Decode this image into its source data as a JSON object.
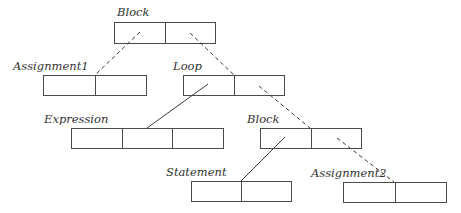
{
  "diagram": {
    "type": "tree",
    "nodes": [
      {
        "id": "block-root",
        "label": "Block",
        "x": 114,
        "y": 22,
        "width": 101,
        "height": 21,
        "cells": 2,
        "label_x": 117,
        "label_y": 16
      },
      {
        "id": "assignment1",
        "label": "Assignment1",
        "x": 43,
        "y": 75,
        "width": 103,
        "height": 20,
        "cells": 2,
        "label_x": 13,
        "label_y": 70
      },
      {
        "id": "loop",
        "label": "Loop",
        "x": 183,
        "y": 75,
        "width": 101,
        "height": 20,
        "cells": 2,
        "label_x": 173,
        "label_y": 70
      },
      {
        "id": "expression",
        "label": "Expression",
        "x": 71,
        "y": 128,
        "width": 152,
        "height": 20,
        "cells": 3,
        "label_x": 44,
        "label_y": 123
      },
      {
        "id": "block-inner",
        "label": "Block",
        "x": 260,
        "y": 128,
        "width": 101,
        "height": 20,
        "cells": 2,
        "label_x": 247,
        "label_y": 123
      },
      {
        "id": "statement",
        "label": "Statement",
        "x": 191,
        "y": 181,
        "width": 100,
        "height": 20,
        "cells": 2,
        "label_x": 166,
        "label_y": 176
      },
      {
        "id": "assignment2",
        "label": "Assignment2",
        "x": 343,
        "y": 182,
        "width": 103,
        "height": 20,
        "cells": 2,
        "label_x": 311,
        "label_y": 177
      }
    ],
    "edges": [
      {
        "from": "block-root",
        "to": "assignment1",
        "style": "dashed",
        "x1": 140,
        "y1": 32,
        "x2": 95,
        "y2": 75
      },
      {
        "from": "block-root",
        "to": "loop",
        "style": "dashed",
        "x1": 190,
        "y1": 33,
        "x2": 234,
        "y2": 75
      },
      {
        "from": "loop",
        "to": "expression",
        "style": "solid",
        "x1": 208,
        "y1": 84,
        "x2": 147,
        "y2": 128
      },
      {
        "from": "loop",
        "to": "block-inner",
        "style": "dashed",
        "x1": 259,
        "y1": 86,
        "x2": 310,
        "y2": 128
      },
      {
        "from": "block-inner",
        "to": "statement",
        "style": "solid",
        "x1": 285,
        "y1": 137,
        "x2": 241,
        "y2": 181
      },
      {
        "from": "block-inner",
        "to": "assignment2",
        "style": "dashed",
        "x1": 337,
        "y1": 138,
        "x2": 394,
        "y2": 182
      }
    ],
    "colors": {
      "stroke": "#4a4a4a",
      "label": "#333333",
      "background": "#ffffff"
    }
  }
}
